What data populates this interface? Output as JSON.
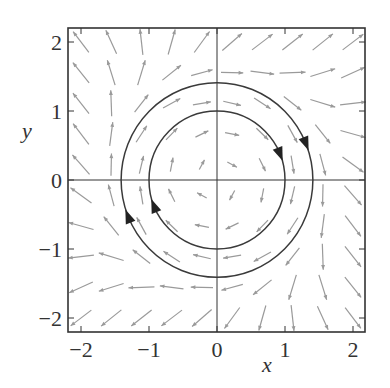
{
  "chart_data": {
    "type": "quiver",
    "title": "",
    "xlabel": "x",
    "ylabel": "y",
    "xlim": [
      -2.2,
      2.2
    ],
    "ylim": [
      -2.2,
      2.2
    ],
    "xticks": [
      "−2",
      "−1",
      "0",
      "1",
      "2"
    ],
    "yticks": [
      "−2",
      "−1",
      "0",
      "1",
      "2"
    ],
    "grid": false,
    "field": {
      "description": "clockwise rotational vector field with radial component",
      "grid_min": -2,
      "grid_max": 2,
      "grid_n": 10
    },
    "trajectories": [
      {
        "name": "inner circle",
        "radius": 1.0,
        "direction": "clockwise"
      },
      {
        "name": "outer circle",
        "radius": 1.41,
        "direction": "clockwise"
      }
    ]
  },
  "colors": {
    "axis": "#333333",
    "arrow": "#9a9a9a",
    "curve": "#3a3a3a"
  }
}
